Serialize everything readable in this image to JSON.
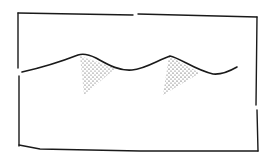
{
  "diagram": {
    "stroke_color": "#1a1a1a",
    "background_color": "#ffffff",
    "frame": {
      "x1": 18,
      "y1": 13,
      "x2": 257,
      "y2": 151
    },
    "wave_points": [
      [
        22,
        72
      ],
      [
        50,
        65
      ],
      [
        78,
        55
      ],
      [
        88,
        56
      ],
      [
        110,
        66
      ],
      [
        130,
        70
      ],
      [
        150,
        64
      ],
      [
        170,
        56
      ],
      [
        190,
        66
      ],
      [
        213,
        74
      ],
      [
        226,
        72
      ],
      [
        237,
        67
      ]
    ],
    "shaded_regions": [
      {
        "name": "left-peak-shading",
        "points": [
          [
            80,
            56
          ],
          [
            84,
            95
          ],
          [
            116,
            68
          ]
        ]
      },
      {
        "name": "right-peak-shading",
        "points": [
          [
            169,
            56
          ],
          [
            163,
            95
          ],
          [
            200,
            73
          ]
        ]
      }
    ]
  }
}
